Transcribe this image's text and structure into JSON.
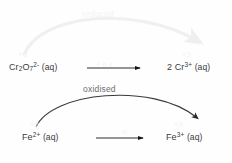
{
  "diagram": {
    "type": "redox-electron-transfer",
    "background_color": "#fefefe"
  },
  "species": {
    "cr_reactant": {
      "name": "dichromate-ion",
      "formula_prefix": "Cr",
      "sub1": "2",
      "element2": "O",
      "sub2": "7",
      "charge": "2-",
      "state": "(aq)",
      "oxidation_state": "+6",
      "color": "#3b3b3b"
    },
    "cr_product": {
      "name": "chromium-iii-ion",
      "coefficient": "2 ",
      "formula_prefix": "Cr",
      "charge": "3+",
      "state": "(aq)",
      "oxidation_state": "+3",
      "color": "#3b3b3b"
    },
    "fe_reactant": {
      "name": "iron-ii-ion",
      "formula_prefix": "Fe",
      "charge": "2+",
      "state": "(aq)",
      "oxidation_state": "+2",
      "color": "#3b3b3b"
    },
    "fe_product": {
      "name": "iron-iii-ion",
      "formula_prefix": "Fe",
      "charge": "3+",
      "state": "(aq)",
      "oxidation_state": "+3",
      "color": "#3b3b3b"
    }
  },
  "labels": {
    "reduced": "reduced",
    "oxidised": "oxidised",
    "electrons_top": "+ 6 e",
    "electrons_top_sup": "-",
    "electrons_bottom": "- e",
    "electrons_bottom_sup": "-"
  },
  "colors": {
    "text_dark": "#3b3b3b",
    "label_gray": "#6d6d6d",
    "faded_light": "#f2f2f2",
    "arrow_dark": "#1a1a1a",
    "arrow_curve_dark": "#303030",
    "arrow_curve_light": "#f0f0f0",
    "background": "#fefefe"
  },
  "arrows": {
    "top_curve": {
      "name": "reduced-curved-arrow",
      "from": "dichromate",
      "to": "chromium-iii",
      "direction": "left-to-right",
      "color": "#f0f0f0"
    },
    "bottom_curve": {
      "name": "oxidised-curved-arrow",
      "from": "iron-ii",
      "to": "iron-iii",
      "direction": "left-to-right",
      "color": "#303030"
    },
    "top_straight": {
      "name": "reduction-reaction-arrow",
      "direction": "left-to-right",
      "color": "#1a1a1a"
    },
    "bottom_straight": {
      "name": "oxidation-reaction-arrow",
      "direction": "left-to-right",
      "color": "#1a1a1a"
    }
  }
}
